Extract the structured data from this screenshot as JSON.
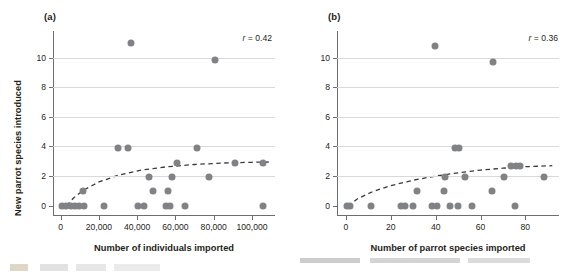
{
  "figure": {
    "panels": [
      {
        "id": "a",
        "label": "(a)",
        "annotation_prefix": "r",
        "annotation_equals": " = ",
        "annotation_value": "0.42"
      },
      {
        "id": "b",
        "label": "(b)",
        "annotation_prefix": "r",
        "annotation_equals": " = ",
        "annotation_value": "0.36"
      }
    ]
  },
  "chart_data": [
    {
      "type": "scatter",
      "panel": "a",
      "title": "(a)",
      "xlabel": "Number of individuals imported",
      "ylabel": "New parrot species introduced",
      "xlim": [
        -4000,
        112000
      ],
      "ylim": [
        -0.7,
        11.8
      ],
      "xticks": [
        0,
        20000,
        40000,
        60000,
        80000,
        100000
      ],
      "xticklabels": [
        "0",
        "20,000",
        "40,000",
        "60,000",
        "80,000",
        "100,000"
      ],
      "yticks": [
        0,
        2,
        4,
        6,
        8,
        10
      ],
      "yticklabels": [
        "0",
        "2",
        "4",
        "6",
        "8",
        "10"
      ],
      "grid": "horizontal",
      "legend": "none",
      "annotations": [
        {
          "text": "r = 0.42",
          "x": 97000,
          "y": 11.2
        }
      ],
      "marker_color": "#808285",
      "points": [
        {
          "x": 900,
          "y": 0
        },
        {
          "x": 2600,
          "y": 0
        },
        {
          "x": 5200,
          "y": 0
        },
        {
          "x": 7400,
          "y": 0
        },
        {
          "x": 9800,
          "y": 0
        },
        {
          "x": 12200,
          "y": 0
        },
        {
          "x": 11800,
          "y": 1.0
        },
        {
          "x": 22500,
          "y": 0
        },
        {
          "x": 30200,
          "y": 3.9
        },
        {
          "x": 35200,
          "y": 3.9
        },
        {
          "x": 36800,
          "y": 11.0
        },
        {
          "x": 40500,
          "y": 0
        },
        {
          "x": 43800,
          "y": 0
        },
        {
          "x": 46000,
          "y": 1.95
        },
        {
          "x": 48500,
          "y": 1.0
        },
        {
          "x": 55300,
          "y": 0
        },
        {
          "x": 57200,
          "y": 0
        },
        {
          "x": 56000,
          "y": 1.0
        },
        {
          "x": 58200,
          "y": 1.95
        },
        {
          "x": 61000,
          "y": 2.9
        },
        {
          "x": 64800,
          "y": 0
        },
        {
          "x": 71500,
          "y": 3.9
        },
        {
          "x": 77500,
          "y": 1.95
        },
        {
          "x": 80800,
          "y": 9.85
        },
        {
          "x": 91000,
          "y": 2.85
        },
        {
          "x": 105500,
          "y": 2.85
        },
        {
          "x": 105800,
          "y": 0
        }
      ],
      "trendline": {
        "style": "dashed",
        "color": "#3a3a3a",
        "shape": "logarithmic",
        "points": [
          {
            "x": 3000,
            "y": 0.0
          },
          {
            "x": 7000,
            "y": 0.55
          },
          {
            "x": 12000,
            "y": 1.05
          },
          {
            "x": 20000,
            "y": 1.6
          },
          {
            "x": 30000,
            "y": 2.05
          },
          {
            "x": 42000,
            "y": 2.4
          },
          {
            "x": 55000,
            "y": 2.62
          },
          {
            "x": 70000,
            "y": 2.78
          },
          {
            "x": 85000,
            "y": 2.88
          },
          {
            "x": 100000,
            "y": 2.93
          },
          {
            "x": 110000,
            "y": 2.95
          }
        ]
      }
    },
    {
      "type": "scatter",
      "panel": "b",
      "title": "(b)",
      "xlabel": "Number of parrot species imported",
      "ylabel": "New parrot species introduced",
      "xlim": [
        -4,
        95
      ],
      "ylim": [
        -0.7,
        11.8
      ],
      "xticks": [
        0,
        20,
        40,
        60,
        80
      ],
      "xticklabels": [
        "0",
        "20",
        "40",
        "60",
        "80"
      ],
      "yticks": [
        0,
        2,
        4,
        6,
        8,
        10
      ],
      "yticklabels": [
        "0",
        "2",
        "4",
        "6",
        "8",
        "10"
      ],
      "grid": "horizontal",
      "legend": "none",
      "annotations": [
        {
          "text": "r = 0.36",
          "x": 82,
          "y": 11.2
        }
      ],
      "marker_color": "#808285",
      "points": [
        {
          "x": 0.4,
          "y": 0
        },
        {
          "x": 1.8,
          "y": 0
        },
        {
          "x": 11.0,
          "y": 0
        },
        {
          "x": 24.5,
          "y": 0
        },
        {
          "x": 26.5,
          "y": 0
        },
        {
          "x": 30.0,
          "y": 0
        },
        {
          "x": 31.5,
          "y": 1.0
        },
        {
          "x": 38.5,
          "y": 0
        },
        {
          "x": 40.5,
          "y": 0
        },
        {
          "x": 43.5,
          "y": 1.0
        },
        {
          "x": 44.0,
          "y": 1.95
        },
        {
          "x": 46.5,
          "y": 0
        },
        {
          "x": 48.5,
          "y": 3.9
        },
        {
          "x": 50.5,
          "y": 3.9
        },
        {
          "x": 50.0,
          "y": 0
        },
        {
          "x": 53.0,
          "y": 1.95
        },
        {
          "x": 39.5,
          "y": 10.8
        },
        {
          "x": 65.5,
          "y": 9.7
        },
        {
          "x": 56.0,
          "y": 0
        },
        {
          "x": 65.0,
          "y": 1.0
        },
        {
          "x": 70.5,
          "y": 1.95
        },
        {
          "x": 73.5,
          "y": 2.7
        },
        {
          "x": 76.0,
          "y": 2.7
        },
        {
          "x": 77.5,
          "y": 2.7
        },
        {
          "x": 75.5,
          "y": 0
        },
        {
          "x": 88.5,
          "y": 1.95
        }
      ],
      "trendline": {
        "style": "dashed",
        "color": "#3a3a3a",
        "shape": "logarithmic",
        "points": [
          {
            "x": 1.0,
            "y": -0.05
          },
          {
            "x": 5.0,
            "y": 0.45
          },
          {
            "x": 12.0,
            "y": 0.95
          },
          {
            "x": 20.0,
            "y": 1.35
          },
          {
            "x": 30.0,
            "y": 1.72
          },
          {
            "x": 40.0,
            "y": 2.0
          },
          {
            "x": 50.0,
            "y": 2.22
          },
          {
            "x": 60.0,
            "y": 2.4
          },
          {
            "x": 70.0,
            "y": 2.53
          },
          {
            "x": 80.0,
            "y": 2.63
          },
          {
            "x": 92.0,
            "y": 2.7
          }
        ]
      }
    }
  ]
}
